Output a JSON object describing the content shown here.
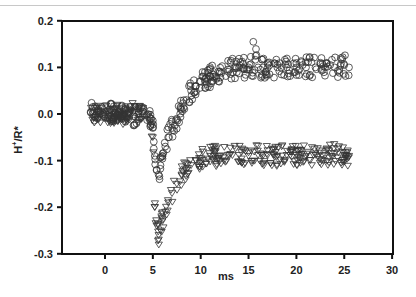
{
  "chart_data": {
    "type": "scatter",
    "title": "",
    "xlabel": "ms",
    "ylabel": "H⁺/R*",
    "xlim": [
      -4.5,
      30
    ],
    "ylim": [
      -0.3,
      0.2
    ],
    "xticks": [
      0,
      5,
      10,
      15,
      20,
      25,
      30
    ],
    "yticks": [
      0.2,
      0.1,
      0.0,
      -0.1,
      -0.2,
      -0.3
    ],
    "xtick_labels": [
      "0",
      "5",
      "10",
      "15",
      "20",
      "25",
      "30"
    ],
    "ytick_labels": [
      "0.2",
      "0.1",
      "0.0",
      "-0.1",
      "-0.2",
      "-0.3"
    ],
    "grid": false,
    "legend": null,
    "series": [
      {
        "name": "circles",
        "marker": "open-circle",
        "x": [
          -0.5,
          0.0,
          0.5,
          1.0,
          1.5,
          2.0,
          2.5,
          3.0,
          3.5,
          4.0,
          4.5,
          5.0,
          5.2,
          5.4,
          5.6,
          5.8,
          6.0,
          6.3,
          6.6,
          7.0,
          7.5,
          8.0,
          8.5,
          9.0,
          9.5,
          10.0,
          11.0,
          12.0,
          13.0,
          14.0,
          15.0,
          15.5,
          16.0,
          17.0,
          18.0,
          19.0,
          20.0,
          21.0,
          22.0,
          23.0,
          24.0,
          25.0,
          25.5
        ],
        "y": [
          0.005,
          0.0,
          0.01,
          -0.005,
          0.005,
          0.0,
          0.01,
          -0.005,
          0.0,
          0.005,
          0.0,
          -0.03,
          -0.09,
          -0.12,
          -0.13,
          -0.11,
          -0.09,
          -0.07,
          -0.05,
          -0.03,
          -0.01,
          0.01,
          0.03,
          0.05,
          0.06,
          0.07,
          0.08,
          0.09,
          0.095,
          0.1,
          0.1,
          0.155,
          0.1,
          0.1,
          0.1,
          0.1,
          0.1,
          0.1,
          0.1,
          0.1,
          0.1,
          0.105,
          0.1
        ]
      },
      {
        "name": "triangles",
        "marker": "open-triangle-down",
        "x": [
          -0.5,
          0.0,
          0.5,
          1.0,
          1.5,
          2.0,
          2.5,
          3.0,
          3.5,
          4.0,
          4.5,
          5.0,
          5.2,
          5.4,
          5.6,
          5.8,
          6.0,
          6.3,
          6.6,
          7.0,
          7.5,
          8.0,
          8.5,
          9.0,
          9.5,
          10.0,
          11.0,
          12.0,
          13.0,
          14.0,
          15.0,
          16.0,
          17.0,
          18.0,
          19.0,
          20.0,
          21.0,
          22.0,
          23.0,
          24.0,
          25.0,
          25.5
        ],
        "y": [
          0.0,
          0.005,
          -0.005,
          0.0,
          0.005,
          -0.005,
          0.0,
          0.005,
          0.0,
          -0.005,
          0.0,
          -0.05,
          -0.2,
          -0.24,
          -0.26,
          -0.25,
          -0.23,
          -0.21,
          -0.19,
          -0.17,
          -0.15,
          -0.13,
          -0.12,
          -0.11,
          -0.1,
          -0.095,
          -0.09,
          -0.09,
          -0.088,
          -0.088,
          -0.09,
          -0.088,
          -0.088,
          -0.09,
          -0.088,
          -0.088,
          -0.09,
          -0.088,
          -0.088,
          -0.085,
          -0.088,
          -0.09
        ]
      }
    ],
    "annotations": []
  },
  "axes": {
    "xlabel": "ms",
    "ylabel_main": "H",
    "ylabel_sup": "+",
    "ylabel_rest": "/R*"
  }
}
